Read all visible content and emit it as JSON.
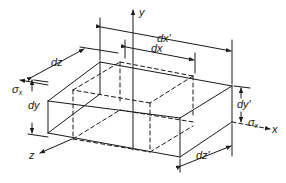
{
  "diagram": {
    "colors": {
      "line": "#1a1a1a",
      "background": "#ffffff"
    },
    "axes": {
      "x": "x",
      "y": "y",
      "z": "z"
    },
    "stress": {
      "left": {
        "symbol": "σ",
        "subscript": "x"
      },
      "right": {
        "symbol": "σ",
        "subscript": "x"
      }
    },
    "dimensions": {
      "original": {
        "dx": "dx",
        "dy": "dy",
        "dz": "dz"
      },
      "deformed": {
        "dx": "dx'",
        "dy": "dy'",
        "dz": "dz'"
      }
    },
    "element_styles": {
      "original": "dashed",
      "deformed": "solid"
    }
  }
}
